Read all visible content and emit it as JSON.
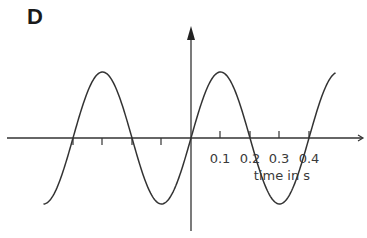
{
  "panel": {
    "label": "D"
  },
  "axes": {
    "xlabel": "time in s",
    "tick_labels": [
      "0.1",
      "0.2",
      "0.3",
      "0.4"
    ],
    "colors": {
      "axis": "#333333",
      "curve": "#333333",
      "text": "#3a3a3a"
    }
  },
  "chart_data": {
    "type": "line",
    "title": "D",
    "xlabel": "time in s",
    "ylabel": "",
    "x_ticks": [
      -0.2,
      -0.15,
      -0.1,
      -0.05,
      0,
      0.1,
      0.2,
      0.3,
      0.4
    ],
    "x_tick_labels": [
      "0.1",
      "0.2",
      "0.3",
      "0.4"
    ],
    "xlim": [
      -0.5,
      0.5
    ],
    "function": "sine",
    "period_s": 0.4,
    "amplitude": "unlabeled",
    "series": [
      {
        "name": "displacement",
        "x": [
          -0.5,
          -0.4,
          -0.3,
          -0.2,
          -0.1,
          0,
          0.1,
          0.2,
          0.3,
          0.4,
          0.49
        ],
        "y": [
          -1,
          0,
          1,
          0,
          -1,
          0,
          1,
          0,
          -1,
          0,
          1
        ]
      }
    ],
    "grid": false,
    "legend": null
  }
}
